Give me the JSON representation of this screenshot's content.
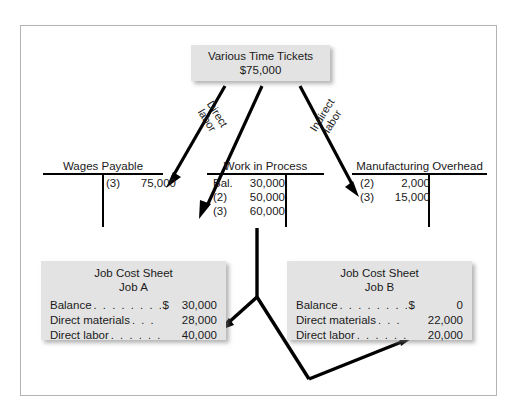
{
  "diagram": {
    "source_box": {
      "title": "Various Time Tickets",
      "amount": "$75,000"
    },
    "edge_labels": {
      "direct_line1": "Direct",
      "direct_line2": "labor",
      "indirect_line1": "Indirect",
      "indirect_line2": "labor"
    },
    "t_accounts": [
      {
        "name": "Wages Payable",
        "debit_entries": [],
        "credit_entries": [
          {
            "ref": "(3)",
            "amount": "75,000"
          }
        ]
      },
      {
        "name": "Work in Process",
        "debit_entries": [
          {
            "ref": "Bal.",
            "amount": "30,000"
          },
          {
            "ref": "(2)",
            "amount": "50,000"
          },
          {
            "ref": "(3)",
            "amount": "60,000"
          }
        ],
        "credit_entries": []
      },
      {
        "name": "Manufacturing Overhead",
        "debit_entries": [
          {
            "ref": "(2)",
            "amount": "2,000"
          },
          {
            "ref": "(3)",
            "amount": "15,000"
          }
        ],
        "credit_entries": []
      }
    ],
    "job_cost_sheets": [
      {
        "title": "Job Cost Sheet",
        "subtitle": "Job A",
        "rows": [
          {
            "label": "Balance",
            "dots": ". . . . . . . . .",
            "currency": "$",
            "amount": "30,000"
          },
          {
            "label": "Direct materials",
            "dots": ". . .",
            "currency": "",
            "amount": "28,000"
          },
          {
            "label": "Direct labor",
            "dots": ". . . . . .",
            "currency": "",
            "amount": "40,000"
          }
        ]
      },
      {
        "title": "Job Cost Sheet",
        "subtitle": "Job B",
        "rows": [
          {
            "label": "Balance",
            "dots": ". . . . . . . . .",
            "currency": "$",
            "amount": "0"
          },
          {
            "label": "Direct materials",
            "dots": ". . .",
            "currency": "",
            "amount": "22,000"
          },
          {
            "label": "Direct labor",
            "dots": ". . . . . .",
            "currency": "",
            "amount": "20,000"
          }
        ]
      }
    ],
    "colors": {
      "box_fill": "#e3e3e3",
      "line": "#000000",
      "frame_border": "#b4b4b4",
      "text": "#1a1a1a"
    }
  }
}
